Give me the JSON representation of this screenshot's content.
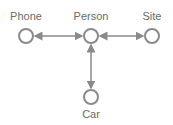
{
  "diagram": {
    "nodes": [
      {
        "id": "phone",
        "label": "Phone",
        "x": 26,
        "y": 36
      },
      {
        "id": "person",
        "label": "Person",
        "x": 91,
        "y": 36
      },
      {
        "id": "site",
        "label": "Site",
        "x": 152,
        "y": 36
      },
      {
        "id": "car",
        "label": "Car",
        "x": 91,
        "y": 97
      }
    ],
    "edges": [
      {
        "from": "phone",
        "to": "person",
        "direction": "both"
      },
      {
        "from": "person",
        "to": "site",
        "direction": "both"
      },
      {
        "from": "person",
        "to": "car",
        "direction": "both"
      }
    ],
    "colors": {
      "stroke": "#8a8a8a",
      "label": "#6b6b6b",
      "fill": "#ffffff"
    }
  }
}
